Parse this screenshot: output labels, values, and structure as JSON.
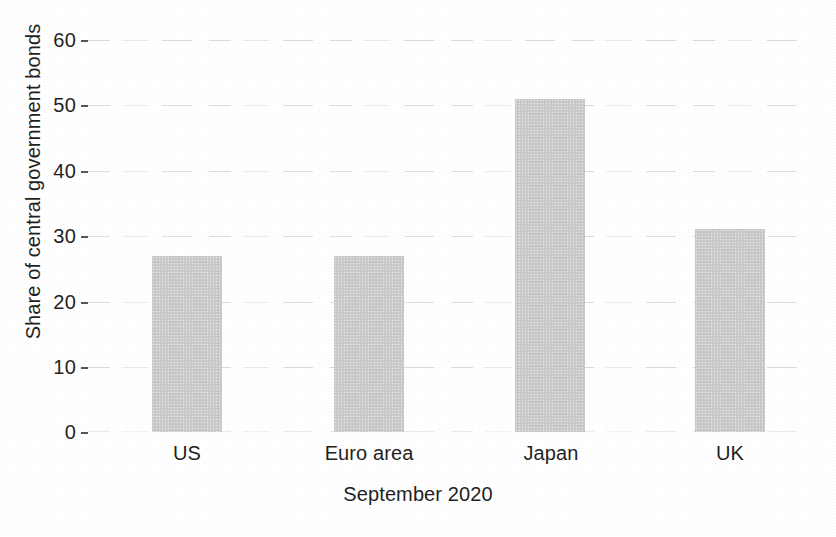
{
  "chart_data": {
    "type": "bar",
    "title": "",
    "subtitle": "",
    "xlabel": "September 2020",
    "ylabel": "Share of central government bonds",
    "categories": [
      "US",
      "Euro area",
      "Japan",
      "UK"
    ],
    "values": [
      27,
      27,
      51,
      31
    ],
    "series": [
      {
        "name": "Share of central government bonds",
        "values": [
          27,
          27,
          51,
          31
        ]
      }
    ],
    "ylim": [
      0,
      60
    ],
    "ytick_labels": [
      "0",
      "10",
      "20",
      "30",
      "40",
      "50",
      "60"
    ],
    "ytick_values": [
      0,
      10,
      20,
      30,
      40,
      50,
      60
    ],
    "grid": true,
    "grid_axis": "y",
    "legend": false,
    "legend_position": "none",
    "annotations": [],
    "bar_color": "#c9c9c9",
    "text_color": "#1f1f21",
    "background_color": "#ffffff",
    "gridline_color": "#b0b3b7"
  }
}
